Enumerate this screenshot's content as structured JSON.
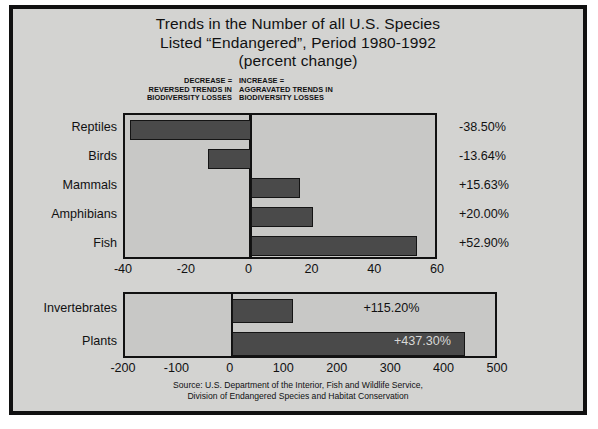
{
  "chart_data": {
    "type": "bar",
    "title": "Trends in the Number of all U.S. Species Listed “Endangered”, Period 1980-1992 (percent change)",
    "title_lines": [
      "Trends in the Number of all U.S. Species",
      "Listed “Endangered”, Period 1980-1992",
      "(percent change)"
    ],
    "orientation": "horizontal",
    "xlabel": "",
    "ylabel": "",
    "grid": false,
    "legend_position": "none",
    "annotations": [
      {
        "id": "decrease",
        "text": "DECREASE = REVERSED TRENDS IN BIODIVERSITY LOSSES",
        "lines": [
          "DECREASE =",
          "REVERSED TRENDS IN",
          "BIODIVERSITY LOSSES"
        ],
        "side": "left"
      },
      {
        "id": "increase",
        "text": "INCREASE = AGGRAVATED TRENDS IN BIODIVERSITY LOSSES",
        "lines": [
          "INCREASE =",
          "AGGRAVATED TRENDS IN",
          "BIODIVERSITY LOSSES"
        ],
        "side": "right"
      }
    ],
    "panels": [
      {
        "id": "vertebrates",
        "xlim": [
          -40,
          60
        ],
        "ticks": [
          "-40",
          "-20",
          "0",
          "20",
          "40",
          "60"
        ],
        "tick_values": [
          -40,
          -20,
          0,
          20,
          40,
          60
        ],
        "categories": [
          "Reptiles",
          "Birds",
          "Mammals",
          "Amphibians",
          "Fish"
        ],
        "values": [
          -38.5,
          -13.64,
          15.63,
          20.0,
          52.9
        ],
        "value_labels": [
          "-38.50%",
          "-13.64%",
          "+15.63%",
          "+20.00%",
          "+52.90%"
        ],
        "label_inside": [
          false,
          false,
          false,
          false,
          false
        ]
      },
      {
        "id": "invertebrates-plants",
        "xlim": [
          -200,
          500
        ],
        "ticks": [
          "-200",
          "-100",
          "0",
          "100",
          "200",
          "300",
          "400",
          "500"
        ],
        "tick_values": [
          -200,
          -100,
          0,
          100,
          200,
          300,
          400,
          500
        ],
        "categories": [
          "Invertebrates",
          "Plants"
        ],
        "values": [
          115.2,
          437.3
        ],
        "value_labels": [
          "+115.20%",
          "+437.30%"
        ],
        "label_inside": [
          false,
          true
        ]
      }
    ],
    "source_lines": [
      "Source: U.S. Department of the Interior, Fish and Wildlife Service,",
      "Division of Endangered Species and Habitat Conservation"
    ],
    "colors": {
      "figure_background": "#d3d3d1",
      "plot_background": "#c8c8c6",
      "bar_fill": "#4a4a4a",
      "bar_edge": "#141414",
      "frame": "#111111",
      "text": "#111111",
      "inside_label_text": "#d8d8d6"
    }
  }
}
